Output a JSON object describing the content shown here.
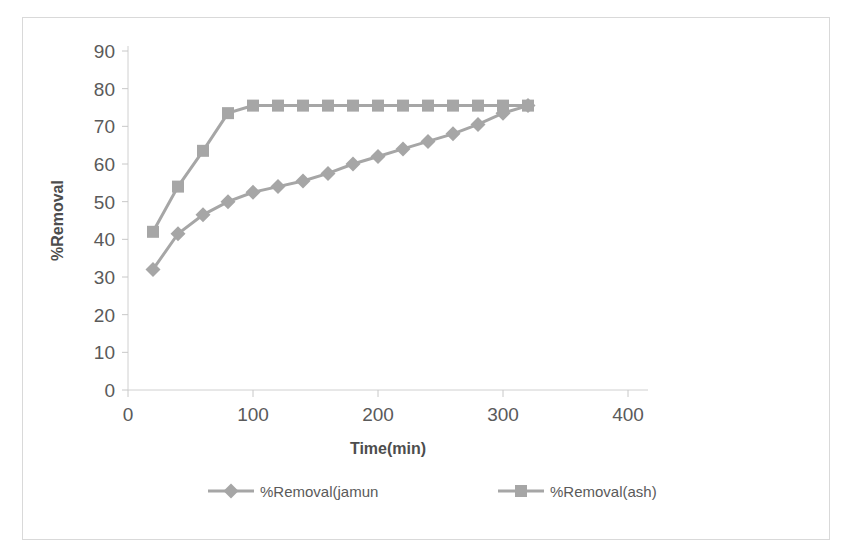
{
  "chart_data": {
    "type": "line",
    "title": "",
    "xlabel": "Time(min)",
    "ylabel": "%Removal",
    "xlim": [
      0,
      400
    ],
    "ylim": [
      0,
      90
    ],
    "xticks": [
      0,
      100,
      200,
      300,
      400
    ],
    "yticks": [
      0,
      10,
      20,
      30,
      40,
      50,
      60,
      70,
      80,
      90
    ],
    "grid": false,
    "legend_position": "bottom",
    "series": [
      {
        "name": "%Removal(jamun",
        "marker": "diamond",
        "color": "#a6a6a6",
        "x": [
          20,
          40,
          60,
          80,
          100,
          120,
          140,
          160,
          180,
          200,
          220,
          240,
          260,
          280,
          300,
          320
        ],
        "y": [
          32,
          41.5,
          46.5,
          50,
          52.5,
          54,
          55.5,
          57.5,
          60,
          62,
          64,
          66,
          68,
          70.5,
          73.5,
          75.5
        ]
      },
      {
        "name": "%Removal(ash)",
        "marker": "square",
        "color": "#a6a6a6",
        "x": [
          20,
          40,
          60,
          80,
          100,
          120,
          140,
          160,
          180,
          200,
          220,
          240,
          260,
          280,
          300,
          320
        ],
        "y": [
          42,
          54,
          63.5,
          73.5,
          75.5,
          75.5,
          75.5,
          75.5,
          75.5,
          75.5,
          75.5,
          75.5,
          75.5,
          75.5,
          75.5,
          75.5
        ]
      }
    ]
  },
  "legend": {
    "items": [
      {
        "label": "%Removal(jamun",
        "marker": "diamond"
      },
      {
        "label": "%Removal(ash)",
        "marker": "square"
      }
    ]
  },
  "axis_titles": {
    "x": "Time(min)",
    "y": "%Removal"
  }
}
